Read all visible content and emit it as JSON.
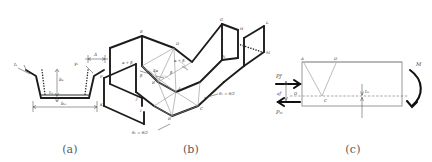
{
  "figure": {
    "background": "#ffffff",
    "ink": "#1c1c1c",
    "accent_light": "#8e8e8e"
  },
  "panels": [
    {
      "id": "a",
      "caption": "(a)",
      "description": "trapezoidal channel cross-section",
      "labels": {
        "flange_angle": "γₖ",
        "left_corner": "tₖ",
        "flange_height": "bₑ",
        "web_thickness": "tₘ",
        "bottom_width": "bₘ",
        "top_gap": "Δ"
      }
    },
    {
      "id": "b",
      "caption": "(b)",
      "description": "three-dimensional yield-line collapse mechanism of the folded channel",
      "vertices": [
        "A",
        "B",
        "C",
        "D",
        "E",
        "F",
        "G",
        "H",
        "I",
        "J",
        "K",
        "L",
        "M",
        "N"
      ],
      "angle_labels": {
        "left": "α + β",
        "right": "α + β",
        "center": "2α",
        "beta_left": "β",
        "beta_right": "β"
      },
      "fold_annotations": {
        "upper": "θ₁ = θ/2",
        "lower": "θ₁ = θ/2"
      }
    },
    {
      "id": "c",
      "caption": "(c)",
      "description": "side elevation with applied flange and web forces and end moment",
      "vertices": {
        "top_left": "A",
        "top_right": "D",
        "mid": "C",
        "origin": "O"
      },
      "forces": {
        "flange_force": "Pƒ",
        "flange_eccentricity": "eƒ",
        "web_force": "Pₘ",
        "web_thickness": "tₘ",
        "moment": "M"
      }
    }
  ]
}
